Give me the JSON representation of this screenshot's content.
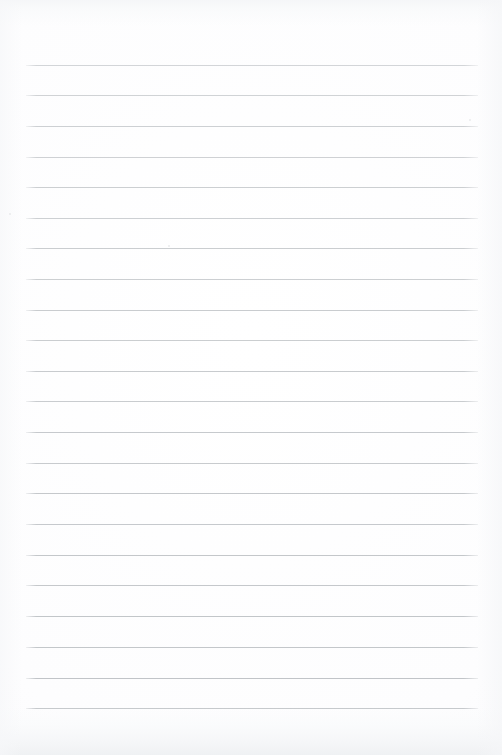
{
  "document": {
    "kind": "scanned-ruled-paper",
    "title": "Blank Ruled Notepad Page",
    "page_width": 502,
    "page_height": 755,
    "background_color": "#fdfdfd",
    "written_content": "",
    "visible_text": ""
  },
  "ruling": {
    "line_color": "#b9bdc1",
    "line_thickness": 1,
    "line_count": 22,
    "left_x": 26,
    "right_x": 478,
    "first_line_y": 65,
    "line_spacing": 30.6,
    "lines": [
      {
        "y": 65,
        "x1": 26,
        "x2": 478,
        "opacity": 0.62
      },
      {
        "y": 95,
        "x1": 26,
        "x2": 478,
        "opacity": 0.66
      },
      {
        "y": 126,
        "x1": 26,
        "x2": 478,
        "opacity": 0.7
      },
      {
        "y": 157,
        "x1": 26,
        "x2": 478,
        "opacity": 0.68
      },
      {
        "y": 187,
        "x1": 26,
        "x2": 478,
        "opacity": 0.72
      },
      {
        "y": 218,
        "x1": 26,
        "x2": 478,
        "opacity": 0.7
      },
      {
        "y": 248,
        "x1": 26,
        "x2": 478,
        "opacity": 0.74
      },
      {
        "y": 279,
        "x1": 26,
        "x2": 478,
        "opacity": 0.72
      },
      {
        "y": 310,
        "x1": 26,
        "x2": 478,
        "opacity": 0.76
      },
      {
        "y": 340,
        "x1": 26,
        "x2": 478,
        "opacity": 0.74
      },
      {
        "y": 371,
        "x1": 26,
        "x2": 478,
        "opacity": 0.78
      },
      {
        "y": 401,
        "x1": 26,
        "x2": 478,
        "opacity": 0.76
      },
      {
        "y": 432,
        "x1": 26,
        "x2": 478,
        "opacity": 0.8
      },
      {
        "y": 463,
        "x1": 26,
        "x2": 478,
        "opacity": 0.78
      },
      {
        "y": 493,
        "x1": 26,
        "x2": 478,
        "opacity": 0.82
      },
      {
        "y": 524,
        "x1": 26,
        "x2": 478,
        "opacity": 0.8
      },
      {
        "y": 555,
        "x1": 26,
        "x2": 478,
        "opacity": 0.84
      },
      {
        "y": 585,
        "x1": 26,
        "x2": 478,
        "opacity": 0.82
      },
      {
        "y": 616,
        "x1": 26,
        "x2": 478,
        "opacity": 0.86
      },
      {
        "y": 647,
        "x1": 26,
        "x2": 478,
        "opacity": 0.84
      },
      {
        "y": 678,
        "x1": 26,
        "x2": 478,
        "opacity": 0.88
      },
      {
        "y": 708,
        "x1": 26,
        "x2": 478,
        "opacity": 0.86
      }
    ]
  },
  "artifacts": {
    "specks": [
      {
        "x": 168,
        "y": 245
      },
      {
        "x": 469,
        "y": 119
      },
      {
        "x": 9,
        "y": 213
      }
    ],
    "top_shadow_color": "#f4f5f7",
    "bottom_shadow_color": "#eef0f2",
    "edge_shadow_color": "#f6f7f9"
  }
}
